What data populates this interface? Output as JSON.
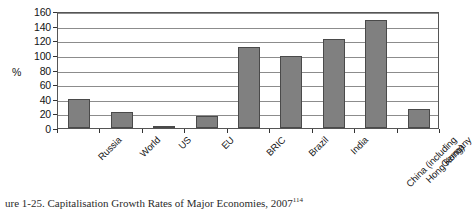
{
  "chart_data": {
    "type": "bar",
    "title": "",
    "xlabel": "",
    "ylabel": "%",
    "ylim": [
      0,
      160
    ],
    "ytick_step": 20,
    "yticks": [
      0,
      20,
      40,
      60,
      80,
      100,
      120,
      140,
      160
    ],
    "grid": true,
    "legend": "none",
    "bar_color": "#808080",
    "bar_edge_color": "#4a4a4a",
    "categories": [
      "Russia",
      "World",
      "US",
      "EU",
      "BRIC",
      "Brazil",
      "China (including\nHong Kong)",
      "India",
      "Germany"
    ],
    "categories_ordered": [
      "Russia",
      "World",
      "US",
      "EU",
      "BRIC",
      "Brazil",
      "India",
      "China (including Hong Kong)",
      "Germany"
    ],
    "values": [
      40,
      22,
      1,
      16,
      111,
      98,
      122,
      148,
      26
    ],
    "points": [
      {
        "label": "Russia",
        "label_line1": "Russia",
        "label_line2": "",
        "value": 40
      },
      {
        "label": "World",
        "label_line1": "World",
        "label_line2": "",
        "value": 22
      },
      {
        "label": "US",
        "label_line1": "US",
        "label_line2": "",
        "value": 1
      },
      {
        "label": "EU",
        "label_line1": "EU",
        "label_line2": "",
        "value": 16
      },
      {
        "label": "BRIC",
        "label_line1": "BRIC",
        "label_line2": "",
        "value": 111
      },
      {
        "label": "Brazil",
        "label_line1": "Brazil",
        "label_line2": "",
        "value": 98
      },
      {
        "label": "India",
        "label_line1": "India",
        "label_line2": "",
        "value": 122
      },
      {
        "label": "China (including Hong Kong)",
        "label_line1": "China (including",
        "label_line2": "Hong Kong)",
        "value": 148
      },
      {
        "label": "Germany",
        "label_line1": "Germany",
        "label_line2": "",
        "value": 26
      }
    ]
  },
  "caption": {
    "prefix": "ure 1-25.",
    "text": "Capitalisation Growth Rates of Major Economies, 2007",
    "footnote": "114",
    "full": "ure 1-25. Capitalisation Growth Rates of Major Economies, 2007 114"
  }
}
